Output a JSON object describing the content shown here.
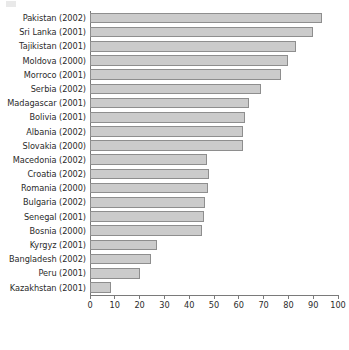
{
  "chart_data": {
    "type": "bar",
    "orientation": "horizontal",
    "title": "",
    "subtitle": "",
    "xlabel": "",
    "ylabel": "",
    "xlim": [
      0,
      100
    ],
    "grid": false,
    "legend": null,
    "xticks": [
      0,
      10,
      20,
      30,
      40,
      50,
      60,
      70,
      80,
      90,
      100
    ],
    "xtick_labels": [
      "0",
      "10",
      "20",
      "30",
      "40",
      "50",
      "60",
      "70",
      "80",
      "90",
      "100"
    ],
    "categories": [
      "Pakistan (2002)",
      "Sri Lanka (2001)",
      "Tajikistan (2001)",
      "Moldova (2000)",
      "Morroco (2001)",
      "Serbia (2002)",
      "Madagascar (2001)",
      "Bolivia (2001)",
      "Albania (2002)",
      "Slovakia (2000)",
      "Macedonia (2002)",
      "Croatia (2002)",
      "Romania (2000)",
      "Bulgaria (2002)",
      "Senegal (2001)",
      "Bosnia (2000)",
      "Kyrgyz (2001)",
      "Bangladesh (2002)",
      "Peru (2001)",
      "Kazakhstan (2001)"
    ],
    "values": [
      93.5,
      90.0,
      83.0,
      80.0,
      77.0,
      69.0,
      64.0,
      62.5,
      61.5,
      61.5,
      47.0,
      48.0,
      47.5,
      46.5,
      46.0,
      45.0,
      27.0,
      24.5,
      20.0,
      8.5
    ],
    "bar_color": "#cbcbcb",
    "bar_edge_color": "#8e8e8e",
    "axis_color": "#7a7a7a",
    "text_color": "#2b2b2b"
  }
}
